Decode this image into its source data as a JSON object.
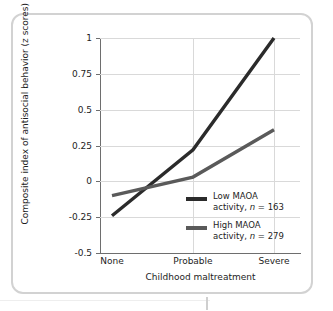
{
  "chart_data": {
    "type": "line",
    "title": "",
    "xlabel": "Childhood maltreatment",
    "ylabel": "Composite index of antisocial behavior (z scores)",
    "categories": [
      "None",
      "Probable",
      "Severe"
    ],
    "ylim": [
      -0.5,
      1
    ],
    "yticks": [
      "-0.5",
      "-0.25",
      "0",
      "0.25",
      "0.5",
      "0.75",
      "1"
    ],
    "ytick_values": [
      -0.5,
      -0.25,
      0,
      0.25,
      0.5,
      0.75,
      1
    ],
    "grid": "horizontal-and-vertical",
    "legend_position": "inside-lower-right",
    "series": [
      {
        "name": "Low MAOA activity, n = 163",
        "label_line1": "Low MAOA",
        "label_line2_prefix": "activity, ",
        "label_line2_italic": "n",
        "label_line2_suffix": " = 163",
        "n": 163,
        "color": "#2b2b2b",
        "values": [
          -0.24,
          0.22,
          1.0
        ]
      },
      {
        "name": "High MAOA activity, n = 279",
        "label_line1": "High MAOA",
        "label_line2_prefix": "activity, ",
        "label_line2_italic": "n",
        "label_line2_suffix": " = 279",
        "n": 279,
        "color": "#5a5a5a",
        "values": [
          -0.1,
          0.03,
          0.36
        ]
      }
    ]
  },
  "colors": {
    "frame_border": "#d2d2d2",
    "gridline": "#d9d9d9",
    "axis": "#6e6e6e",
    "text": "#1d1d1d"
  }
}
